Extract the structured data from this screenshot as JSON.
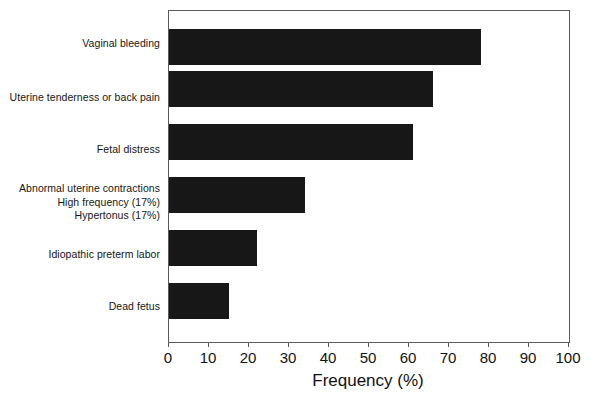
{
  "chart_data": {
    "type": "bar",
    "orientation": "horizontal",
    "title": "",
    "xlabel": "Frequency (%)",
    "ylabel": "",
    "xlim": [
      0,
      100
    ],
    "xticks": [
      0,
      10,
      20,
      30,
      40,
      50,
      60,
      70,
      80,
      90,
      100
    ],
    "grid": false,
    "legend": null,
    "bar_color": "#171717",
    "categories": [
      "Vaginal bleeding",
      "Uterine tenderness or back pain",
      "Fetal distress",
      "Abnormal uterine contractions\nHigh frequency (17%)\nHypertonus (17%)",
      "Idiopathic preterm labor",
      "Dead fetus"
    ],
    "values": [
      78,
      66,
      61,
      34,
      22,
      15
    ],
    "annotations": [
      "High frequency (17%)",
      "Hypertonus (17%)"
    ]
  },
  "axis": {
    "x_title": "Frequency (%)",
    "tick_labels": [
      "0",
      "10",
      "20",
      "30",
      "40",
      "50",
      "60",
      "70",
      "80",
      "90",
      "100"
    ]
  },
  "categories": [
    {
      "label": "Vaginal bleeding"
    },
    {
      "label": "Uterine tenderness or back pain"
    },
    {
      "label": "Fetal distress"
    },
    {
      "label": "Abnormal uterine contractions\nHigh frequency (17%)\nHypertonus (17%)"
    },
    {
      "label": "Idiopathic preterm labor"
    },
    {
      "label": "Dead fetus"
    }
  ]
}
